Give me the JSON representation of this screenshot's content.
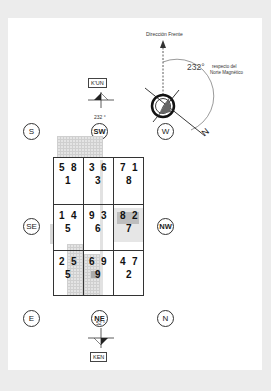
{
  "compass": {
    "front_label": "Dirección Frente",
    "angle_label": "232°",
    "reference_label_line1": "respecto del",
    "reference_label_line2": "Norte Magnético",
    "north_marker": "N"
  },
  "top_trigram": {
    "name": "K'UN",
    "degrees": "232 °"
  },
  "bottom_trigram": {
    "name": "KEN",
    "degrees": "52 °"
  },
  "directions": {
    "s": "S",
    "sw": "SW",
    "w": "W",
    "se": "SE",
    "nw": "NW",
    "e": "E",
    "ne": "NE",
    "n": "N"
  },
  "grid": {
    "cells": [
      {
        "top_left": "5",
        "top_right": "8",
        "center": "1"
      },
      {
        "top_left": "3",
        "top_right": "6",
        "center": "3"
      },
      {
        "top_left": "7",
        "top_right": "1",
        "center": "8"
      },
      {
        "top_left": "1",
        "top_right": "4",
        "center": "5"
      },
      {
        "top_left": "9",
        "top_right": "3",
        "center": "6"
      },
      {
        "top_left": "8",
        "top_right": "2",
        "center": "7"
      },
      {
        "top_left": "2",
        "top_right": "5",
        "center": "5"
      },
      {
        "top_left": "6",
        "top_right": "9",
        "center": "9"
      },
      {
        "top_left": "4",
        "top_right": "7",
        "center": "2"
      }
    ]
  }
}
